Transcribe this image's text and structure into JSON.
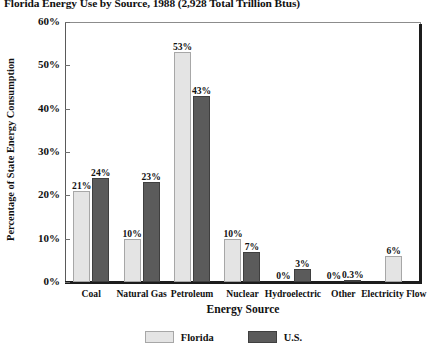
{
  "chart_data": {
    "type": "bar",
    "title": "Florida Energy Use by Source, 1988 (2,928 Total Trillion Btus)",
    "xlabel": "Energy Source",
    "ylabel": "Percentage of State Energy Consumption",
    "ylim": [
      0,
      60
    ],
    "yticks": [
      0,
      10,
      20,
      30,
      40,
      50,
      60
    ],
    "ytick_labels": [
      "0%",
      "10%",
      "20%",
      "30%",
      "40%",
      "50%",
      "60%"
    ],
    "grid": false,
    "legend_position": "bottom",
    "categories": [
      "Coal",
      "Natural Gas",
      "Petroleum",
      "Nuclear",
      "Hydroelectric",
      "Other",
      "Electricity Flow"
    ],
    "series": [
      {
        "name": "Florida",
        "color": "#e4e4e4",
        "values": [
          21,
          10,
          53,
          10,
          0,
          0,
          6
        ],
        "labels": [
          "21%",
          "10%",
          "53%",
          "10%",
          "0%",
          "0%",
          "6%"
        ]
      },
      {
        "name": "U.S.",
        "color": "#5b5b5b",
        "values": [
          24,
          23,
          43,
          7,
          3,
          0.3,
          null
        ],
        "labels": [
          "24%",
          "23%",
          "43%",
          "7%",
          "3%",
          "0.3%",
          ""
        ]
      }
    ]
  },
  "legend": {
    "items": [
      {
        "label": "Florida",
        "swatch": "light-gray-swatch"
      },
      {
        "label": "U.S.",
        "swatch": "dark-gray-swatch"
      }
    ]
  }
}
